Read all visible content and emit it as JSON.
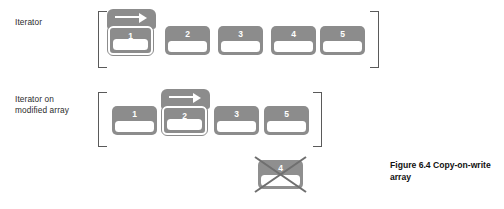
{
  "figure": {
    "caption": "Figure 6.4   Copy-on-write array",
    "background": "#ffffff",
    "cell_fill": "#8c8c8c",
    "slot_fill": "#ffffff",
    "bracket_color": "#5a5a5a",
    "text_color": "#2b2b2b"
  },
  "rows": [
    {
      "label": "Iterator",
      "cells": [
        {
          "value": "1",
          "highlighted": true,
          "removed": false
        },
        {
          "value": "2",
          "highlighted": false,
          "removed": false
        },
        {
          "value": "3",
          "highlighted": false,
          "removed": false
        },
        {
          "value": "4",
          "highlighted": false,
          "removed": false
        },
        {
          "value": "5",
          "highlighted": false,
          "removed": false
        }
      ]
    },
    {
      "label": "Iterator on\nmodified array",
      "cells": [
        {
          "value": "1",
          "highlighted": false,
          "removed": false
        },
        {
          "value": "2",
          "highlighted": true,
          "removed": false
        },
        {
          "value": "3",
          "highlighted": false,
          "removed": false
        },
        {
          "value": "5",
          "highlighted": false,
          "removed": false
        }
      ],
      "detached_cell": {
        "value": "4",
        "highlighted": false,
        "removed": true
      }
    }
  ],
  "icons": {
    "arrow": "right-arrow-icon",
    "cross": "cross-out-icon"
  }
}
